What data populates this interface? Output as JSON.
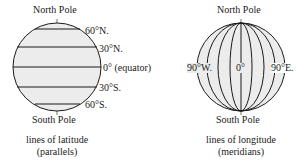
{
  "latitude_diagram": {
    "north_label": "North Pole",
    "south_label": "South Pole",
    "lines": [
      {
        "label": "60°N."
      },
      {
        "label": "30°N."
      },
      {
        "label": "0° (equator)"
      },
      {
        "label": "30°S."
      },
      {
        "label": "60°S."
      }
    ],
    "caption_line1": "lines of latitude",
    "caption_line2": "(parallels)"
  },
  "longitude_diagram": {
    "north_label": "North Pole",
    "south_label": "South Pole",
    "west_label": "90°W.",
    "center_label": "0°",
    "east_label": "90°E.",
    "caption_line1": "lines of longitude",
    "caption_line2": "(meridians)"
  },
  "colors": {
    "globe_fill": "#ececec",
    "line": "#1a1a1a"
  }
}
